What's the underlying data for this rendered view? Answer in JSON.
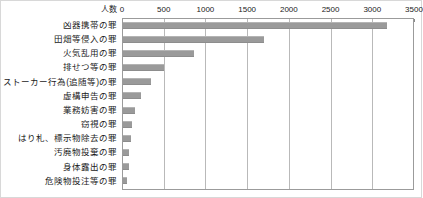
{
  "chart_data": {
    "type": "bar",
    "orientation": "horizontal",
    "title": "",
    "xlabel": "人数",
    "ylabel": "",
    "axis_caption": "人数",
    "xlim": [
      0,
      3500
    ],
    "xticks": [
      0,
      500,
      1000,
      1500,
      2000,
      2500,
      3000,
      3500
    ],
    "xtick_labels": [
      "0",
      "500",
      "1000",
      "1500",
      "2000",
      "2500",
      "3000",
      "3500"
    ],
    "grid": true,
    "grid_axis": "x",
    "axis_position": "top",
    "legend": null,
    "bar_color": "#9a9a9a",
    "categories": [
      "凶器携帯の罪",
      "田畑等侵入の罪",
      "火気乱用の罪",
      "排せつ等の罪",
      "ストーカー行為(追随等)の罪",
      "虚構申告の罪",
      "業務妨害の罪",
      "窃視の罪",
      "はり札、標示物除去の罪",
      "汚廃物投棄の罪",
      "身体露出の罪",
      "危険物投注等の罪"
    ],
    "values": [
      3160,
      1690,
      850,
      490,
      330,
      215,
      145,
      110,
      95,
      70,
      75,
      50
    ]
  },
  "colors": {
    "bar": "#9a9a9a",
    "grid": "#b9b9b9",
    "frame": "#9b9b9b",
    "text": "#1a1a1a",
    "outer_border": "#d8d8d8"
  }
}
